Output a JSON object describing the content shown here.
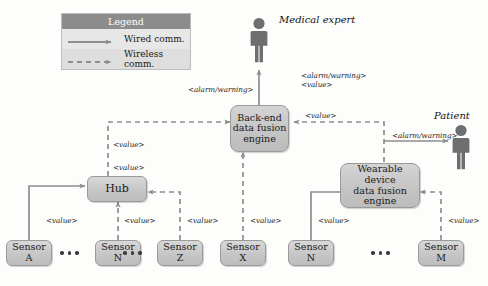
{
  "legend": {
    "title": "Legend",
    "rows": [
      {
        "label": "Wired comm.",
        "style": "solid",
        "icon": "solid-arrow-icon"
      },
      {
        "label": "Wireless comm.",
        "style": "dashed",
        "icon": "dashed-arrow-icon"
      }
    ]
  },
  "actors": [
    {
      "id": "medical-expert",
      "label": "Medical expert",
      "icon": "person-icon"
    },
    {
      "id": "patient",
      "label": "Patient",
      "icon": "person-icon"
    }
  ],
  "nodes": {
    "backend_engine": {
      "lines": [
        "Back-end",
        "data fusion",
        "engine"
      ]
    },
    "wearable_engine": {
      "lines": [
        "Wearable device",
        "data fusion",
        "engine"
      ]
    },
    "hub": {
      "lines": [
        "Hub"
      ]
    },
    "sensors": [
      {
        "id": "sensor-a",
        "lines": [
          "Sensor",
          "A"
        ]
      },
      {
        "id": "sensor-n-left",
        "lines": [
          "Sensor",
          "N"
        ]
      },
      {
        "id": "sensor-z",
        "lines": [
          "Sensor",
          "Z"
        ]
      },
      {
        "id": "sensor-x",
        "lines": [
          "Sensor",
          "X"
        ]
      },
      {
        "id": "sensor-n-right",
        "lines": [
          "Sensor",
          "N"
        ]
      },
      {
        "id": "sensor-m",
        "lines": [
          "Sensor",
          "M"
        ]
      }
    ]
  },
  "edge_labels": {
    "expert_alarm": "<alarm/warning>",
    "backend_to_expert_alarm": "<alarm/warning>",
    "backend_to_expert_value": "<value>",
    "patient_alarm": "<alarm/warning>",
    "hub_to_backend_value": "<value>",
    "hub_upper_value": "<value>",
    "hub_lower_value": "<value>",
    "wearable_to_backend_value": "<value>",
    "sensor_a_value": "<value>",
    "sensor_n_left_value": "<value>",
    "sensor_z_value": "<value>",
    "sensor_x_value": "<value>",
    "sensor_n_right_value": "<value>",
    "sensor_m_value": "<value>"
  },
  "colors": {
    "node_fill": "#c6c6c6",
    "node_border": "#9a9a9a",
    "legend_header": "#8c8c8c",
    "legend_body": "#e7e7e7",
    "wire": "#8d8d8d",
    "actor": "#6e6e6e",
    "background": "#fdfdfc"
  }
}
